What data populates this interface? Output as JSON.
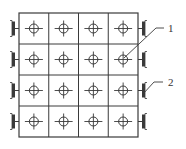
{
  "diagram": {
    "type": "grid-layout-drawing",
    "rows": 4,
    "columns": 4,
    "line_color": "#3a3a3a",
    "background": "#ffffff",
    "grid": {
      "left": 19,
      "top": 13,
      "right": 138,
      "bottom": 137
    },
    "cell_symbol": "circle-crosshair",
    "edge_symbol": "bracket-clamp",
    "edge_symbol_rows_left": [
      0,
      1,
      2,
      3
    ],
    "edge_symbol_rows_right": [
      0,
      1,
      2,
      3
    ],
    "labels": [
      {
        "id": "1",
        "text": "1",
        "x": 168,
        "y": 23,
        "points_to": "crosshair hole row 2 col 4"
      },
      {
        "id": "2",
        "text": "2",
        "x": 168,
        "y": 77,
        "points_to": "right edge clamp row 3"
      }
    ]
  }
}
